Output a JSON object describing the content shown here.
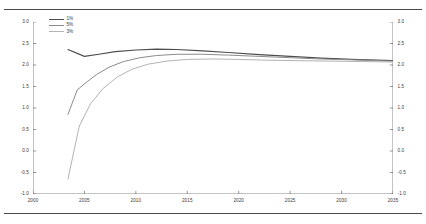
{
  "chart_data": {
    "type": "line",
    "title": "",
    "subtitle": "",
    "xlabel": "",
    "ylabel": "",
    "xlim": [
      2000,
      2035
    ],
    "ylim": [
      -1.0,
      3.0
    ],
    "grid": false,
    "dual_y_axis": true,
    "legend_position": "top-left",
    "xticks": [
      "2000",
      "2005",
      "2010",
      "2015",
      "2020",
      "2025",
      "2030",
      "2035"
    ],
    "xtick_values": [
      2000,
      2005,
      2010,
      2015,
      2020,
      2025,
      2030,
      2035
    ],
    "yticks_left": [
      "3.0",
      "2.5",
      "2.0",
      "1.5",
      "1.0",
      "0.5",
      "0.0",
      "-0.5",
      "-1.0"
    ],
    "ytick_values_left": [
      3.0,
      2.5,
      2.0,
      1.5,
      1.0,
      0.5,
      0.0,
      -0.5,
      -1.0
    ],
    "yticks_right": [
      "3.0",
      "2.5",
      "2.0",
      "1.5",
      "1.0",
      "0.5",
      "0.0",
      "-0.5",
      "-1.0"
    ],
    "ytick_values_right": [
      3.0,
      2.5,
      2.0,
      1.5,
      1.0,
      0.5,
      0.0,
      -0.5,
      -1.0
    ],
    "series": [
      {
        "name": "1%",
        "color": "#4d4d4d",
        "width": 1.15,
        "x": [
          2003.4,
          2005.0,
          2006.4,
          2008.0,
          2010.0,
          2012.0,
          2014.0,
          2016.5,
          2019.0,
          2022.0,
          2025.0,
          2028.0,
          2031.0,
          2035.0
        ],
        "values": [
          2.36,
          2.2,
          2.25,
          2.31,
          2.35,
          2.37,
          2.36,
          2.33,
          2.29,
          2.24,
          2.2,
          2.16,
          2.13,
          2.1
        ]
      },
      {
        "name": "5%",
        "color": "#8c8c8c",
        "width": 1.0,
        "x": [
          2003.4,
          2004.3,
          2005.2,
          2006.2,
          2007.4,
          2008.8,
          2010.4,
          2012.0,
          2014.0,
          2016.5,
          2019.0,
          2022.0,
          2025.0,
          2028.0,
          2031.0,
          2035.0
        ],
        "values": [
          0.85,
          1.42,
          1.6,
          1.78,
          1.95,
          2.08,
          2.17,
          2.22,
          2.25,
          2.25,
          2.23,
          2.2,
          2.17,
          2.14,
          2.12,
          2.09
        ]
      },
      {
        "name": "3%",
        "color": "#b3b3b3",
        "width": 1.0,
        "x": [
          2003.4,
          2004.5,
          2005.6,
          2006.8,
          2008.2,
          2009.6,
          2011.2,
          2013.0,
          2015.0,
          2017.5,
          2020.0,
          2023.0,
          2026.0,
          2029.0,
          2032.0,
          2035.0
        ],
        "values": [
          -0.65,
          0.58,
          1.1,
          1.45,
          1.72,
          1.9,
          2.02,
          2.09,
          2.13,
          2.14,
          2.13,
          2.11,
          2.1,
          2.09,
          2.08,
          2.07
        ]
      }
    ]
  },
  "legend": {
    "items": [
      {
        "label": "1%"
      },
      {
        "label": "5%"
      },
      {
        "label": "3%"
      }
    ]
  },
  "colors": {
    "axis": "#6b6b6b",
    "text": "#3a3a3a",
    "rule": "#4a4a4a",
    "background": "#ffffff"
  }
}
